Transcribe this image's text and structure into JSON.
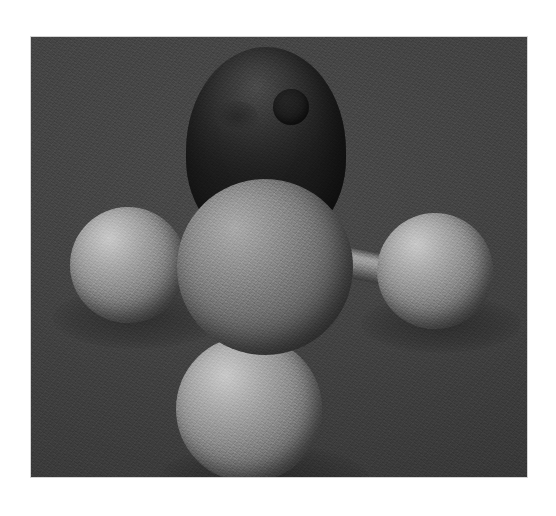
{
  "page": {
    "kind": "rendered-3d-image",
    "background_color": "#ffffff",
    "caption": ""
  },
  "image": {
    "title": "Ball-and-stick molecular model",
    "subject": "methane-like tetrahedral molecule",
    "style": "grayscale ray-traced render",
    "frame": {
      "x": 31,
      "y": 37,
      "width": 496,
      "height": 440,
      "border_color": "#d4d4d4"
    },
    "backdrop_color": "#3d3d3d",
    "light_direction": "upper-left"
  },
  "molecule": {
    "name": "methane",
    "formula": "CH4",
    "geometry": "tetrahedral",
    "atoms": [
      {
        "id": "atom-dark-top",
        "role": "shadowed-upper-atom",
        "color": "#2a2a2a",
        "cx": 235,
        "cy": 110,
        "rx": 80,
        "ry": 100,
        "shape": "ellipsoid"
      },
      {
        "id": "atom-center",
        "role": "central-atom",
        "element_label": "C",
        "color": "#7d7d7d",
        "cx": 234,
        "cy": 230,
        "r": 88,
        "shape": "sphere"
      },
      {
        "id": "atom-left",
        "role": "terminal-atom",
        "element_label": "H",
        "color": "#9a9a9a",
        "cx": 97,
        "cy": 228,
        "r": 58,
        "shape": "sphere"
      },
      {
        "id": "atom-right",
        "role": "terminal-atom",
        "element_label": "H",
        "color": "#9a9a9a",
        "cx": 404,
        "cy": 234,
        "r": 58,
        "shape": "sphere"
      },
      {
        "id": "atom-bottom",
        "role": "terminal-atom",
        "element_label": "H",
        "color": "#9a9a9a",
        "cx": 218,
        "cy": 372,
        "r": 73,
        "shape": "sphere"
      }
    ],
    "spot": {
      "id": "dark-spot",
      "role": "specular-hole",
      "color": "#1b1b1b",
      "cx": 260,
      "cy": 70,
      "r": 18
    },
    "smudge": {
      "id": "dark-smudge",
      "cx": 205,
      "cy": 80,
      "rx": 22,
      "ry": 16
    },
    "bonds": [
      {
        "id": "bond-center-left",
        "from": "atom-center",
        "to": "atom-left",
        "x": 126,
        "y": 208,
        "length": 62,
        "thickness": 29,
        "angle": 2,
        "shading": "dark"
      },
      {
        "id": "bond-center-right",
        "from": "atom-center",
        "to": "atom-right",
        "x": 305,
        "y": 208,
        "length": 62,
        "thickness": 30,
        "angle": 12,
        "shading": "light"
      },
      {
        "id": "bond-center-bottom",
        "from": "atom-center",
        "to": "atom-bottom",
        "x": 213,
        "y": 252,
        "length": 74,
        "thickness": 30,
        "angle": 82,
        "shading": "vertical"
      }
    ]
  }
}
